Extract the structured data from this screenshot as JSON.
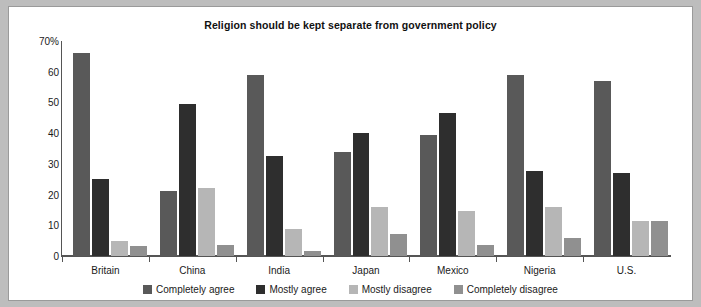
{
  "chart_data": {
    "type": "bar",
    "title": "Religion should be kept separate from government policy",
    "xlabel": "",
    "ylabel": "",
    "ylim": [
      0,
      70
    ],
    "grid": false,
    "legend_position": "bottom",
    "y_ticks": [
      "70%",
      "60",
      "50",
      "40",
      "30",
      "20",
      "10",
      "0"
    ],
    "y_tick_values": [
      70,
      60,
      50,
      40,
      30,
      20,
      10,
      0
    ],
    "categories": [
      "Britain",
      "China",
      "India",
      "Japan",
      "Mexico",
      "Nigeria",
      "U.S."
    ],
    "series": [
      {
        "name": "Completely agree",
        "color": "#595959",
        "values": [
          66,
          21.3,
          59,
          34,
          39.5,
          59,
          57
        ]
      },
      {
        "name": "Mostly agree",
        "color": "#2e2e2e",
        "values": [
          25,
          49.5,
          32.7,
          40,
          46.6,
          27.6,
          27
        ]
      },
      {
        "name": "Mostly disagree",
        "color": "#b6b6b6",
        "values": [
          5,
          22.2,
          8.8,
          16,
          14.5,
          15.8,
          11.4
        ]
      },
      {
        "name": "Completely disagree",
        "color": "#909090",
        "values": [
          3.2,
          3.6,
          1.5,
          7.3,
          3.6,
          6,
          11.4
        ]
      }
    ]
  }
}
